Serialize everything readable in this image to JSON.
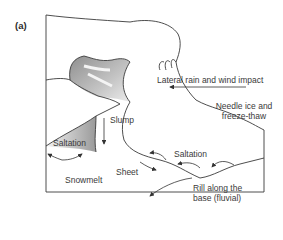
{
  "panel_label": "(a)",
  "labels": {
    "lateral": "Lateral rain and wind impact",
    "needle_1": "Needle ice and",
    "needle_2": "freeze-thaw",
    "slump": "Slump",
    "saltation_left": "Saltation",
    "saltation_right": "Saltation",
    "snowmelt": "Snowmelt",
    "sheet": "Sheet",
    "rill_1": "Rill along the",
    "rill_2": "base (fluvial)"
  },
  "colors": {
    "line": "#3a3a3a",
    "shade_dark": "#9a9a9a",
    "shade_light": "#d8d8d8"
  }
}
